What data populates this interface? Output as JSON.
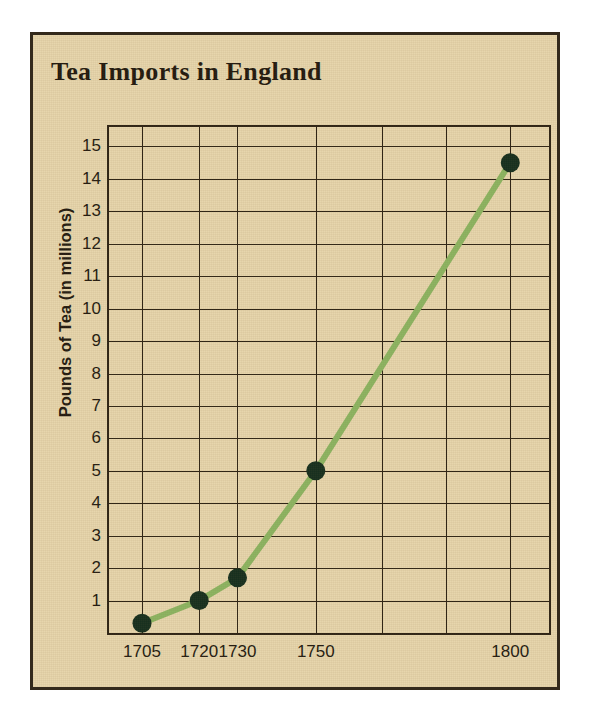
{
  "chart_data": {
    "type": "line",
    "title": "Tea Imports in England",
    "xlabel": "",
    "ylabel": "Pounds of Tea (in millions)",
    "x": [
      1705,
      1720,
      1730,
      1750,
      1800
    ],
    "xtick_labels": [
      "1705",
      "1720",
      "1730",
      "1750",
      "1800"
    ],
    "values": [
      0.3,
      1.0,
      1.7,
      5.0,
      14.5
    ],
    "ytick_labels": [
      "1",
      "2",
      "3",
      "4",
      "5",
      "6",
      "7",
      "8",
      "9",
      "10",
      "11",
      "12",
      "13",
      "14",
      "15"
    ],
    "yticks": [
      1,
      2,
      3,
      4,
      5,
      6,
      7,
      8,
      9,
      10,
      11,
      12,
      13,
      14,
      15
    ],
    "ylim": [
      0,
      15.6
    ],
    "xlim": [
      1700,
      1810
    ],
    "grid": true,
    "legend": false,
    "legend_position": "none",
    "line_color": "#8db562",
    "marker_color": "#17301f",
    "grid_color": "#2e2415",
    "background_color": "#e7d6ad",
    "border_color": "#33291b",
    "series": [
      {
        "name": "Tea imports",
        "points": [
          {
            "x": 1705,
            "y": 0.3
          },
          {
            "x": 1720,
            "y": 1.0
          },
          {
            "x": 1730,
            "y": 1.7
          },
          {
            "x": 1750,
            "y": 5.0
          },
          {
            "x": 1800,
            "y": 14.5
          }
        ]
      }
    ]
  }
}
